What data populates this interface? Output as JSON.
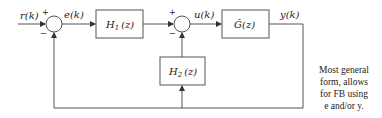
{
  "diagram": {
    "type": "block-diagram",
    "signals": {
      "reference": "r(k)",
      "error": "e(k)",
      "control": "u(k)",
      "output": "y(k)"
    },
    "blocks": {
      "h1": "H",
      "h1_sub": "1",
      "h1_arg": "(z)",
      "h2": "H",
      "h2_sub": "2",
      "h2_arg": "(z)",
      "plant": "G̃(z)"
    },
    "summing_junctions": {
      "sum1": {
        "top_sign": "+",
        "bottom_sign": "−"
      },
      "sum2": {
        "top_sign": "+",
        "bottom_sign": "−"
      }
    },
    "note": {
      "line1": "Most general",
      "line2": "form, allows",
      "line3": "for FB using",
      "line4": "e and/or y."
    },
    "colors": {
      "line": "#555555",
      "text": "#222222",
      "background": "#ffffff"
    }
  }
}
